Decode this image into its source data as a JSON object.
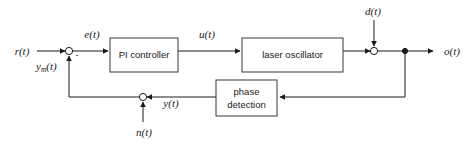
{
  "diagram": {
    "type": "control-system-block-diagram",
    "background_color": "#ffffff",
    "line_color": "#1a1a1a",
    "block_fill": "#ffffff",
    "blocks": [
      {
        "id": "pi-controller",
        "label": "PI controller",
        "x": 110,
        "y": 38,
        "w": 68,
        "h": 34
      },
      {
        "id": "laser-oscillator",
        "label": "laser oscillator",
        "x": 242,
        "y": 38,
        "w": 101,
        "h": 34
      },
      {
        "id": "phase-detection",
        "label_line1": "phase",
        "label_line2": "detection",
        "x": 216,
        "y": 80,
        "w": 61,
        "h": 36
      }
    ],
    "signals": {
      "reference": "r(t)",
      "measured_feedback_base": "y",
      "measured_feedback_sub": "m",
      "measured_feedback_tail": "(t)",
      "error": "e(t)",
      "control": "u(t)",
      "disturbance": "d(t)",
      "output": "o(t)",
      "detected": "y(t)",
      "noise": "n(t)",
      "negative_sign": "-"
    },
    "junctions": [
      {
        "id": "error-summing-junction",
        "cx": 69,
        "cy": 51,
        "r": 3.6
      },
      {
        "id": "disturbance-summing-junction",
        "cx": 374,
        "cy": 51,
        "r": 3.6
      },
      {
        "id": "noise-summing-junction",
        "cx": 143,
        "cy": 97,
        "r": 3.6
      },
      {
        "id": "output-branch-node",
        "cx": 405,
        "cy": 51,
        "r": 2.6
      }
    ]
  }
}
